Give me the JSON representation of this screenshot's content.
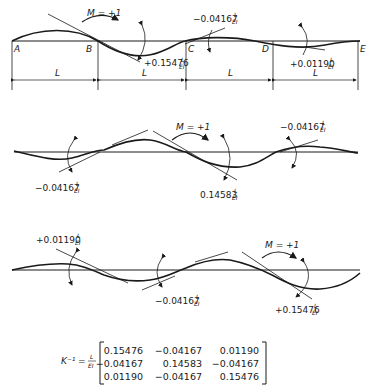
{
  "figure": {
    "panel1": {
      "nodes": [
        "A",
        "B",
        "C",
        "D",
        "E"
      ],
      "span_label": "L",
      "moment_label": "M = +1",
      "rotations": [
        {
          "value": "+0.15476",
          "unit_num": "L",
          "unit_den": "EI"
        },
        {
          "value": "−0.04167",
          "unit_num": "L",
          "unit_den": "EI"
        },
        {
          "value": "+0.01190",
          "unit_num": "L",
          "unit_den": "EI"
        }
      ]
    },
    "panel2": {
      "moment_label": "M = +1",
      "rotations": [
        {
          "value": "−0.04167",
          "unit_num": "L",
          "unit_den": "EI"
        },
        {
          "value": "0.14583",
          "unit_num": "L",
          "unit_den": "EI"
        },
        {
          "value": "−0.04167",
          "unit_num": "L",
          "unit_den": "EI"
        }
      ]
    },
    "panel3": {
      "moment_label": "M = +1",
      "rotations": [
        {
          "value": "+0.01190",
          "unit_num": "L",
          "unit_den": "EI"
        },
        {
          "value": "−0.04167",
          "unit_num": "L",
          "unit_den": "EI"
        },
        {
          "value": "+0.15476",
          "unit_num": "L",
          "unit_den": "EI"
        }
      ]
    },
    "matrix": {
      "lhs": "K⁻¹ =",
      "factor_num": "L",
      "factor_den": "EI",
      "rows": [
        [
          "0.15476",
          "−0.04167",
          "0.01190"
        ],
        [
          "−0.04167",
          "0.14583",
          "−0.04167"
        ],
        [
          "0.01190",
          "−0.04167",
          "0.15476"
        ]
      ]
    }
  }
}
